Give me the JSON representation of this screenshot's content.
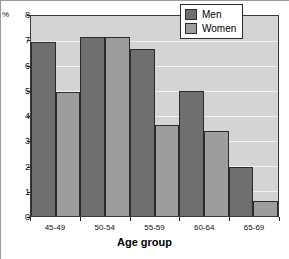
{
  "chart_data": {
    "type": "bar",
    "title": "",
    "subtitle": "",
    "xlabel": "Age group",
    "ylabel": "%",
    "unit_label": "%",
    "categories": [
      "45-49",
      "50-54",
      "55-59",
      "60-64",
      "65-69"
    ],
    "series": [
      {
        "name": "Men",
        "color": "#6f6f6f",
        "values": [
          6.95,
          7.15,
          6.7,
          5.0,
          1.95
        ]
      },
      {
        "name": "Women",
        "color": "#9d9d9d",
        "values": [
          4.95,
          7.15,
          3.65,
          3.4,
          0.6
        ]
      }
    ],
    "ylim": [
      0,
      8
    ],
    "ytick_labels": [
      "8",
      "7",
      "6",
      "5",
      "4",
      "3",
      "2",
      "1",
      "0"
    ],
    "ytick_values": [
      8,
      7,
      6,
      5,
      4,
      3,
      2,
      1,
      0
    ],
    "grid": true,
    "grid_color": "#f2f2f2",
    "plot_background": "#d4d4d4",
    "legend_position": "top-right",
    "legend_entries": [
      "Men",
      "Women"
    ]
  }
}
